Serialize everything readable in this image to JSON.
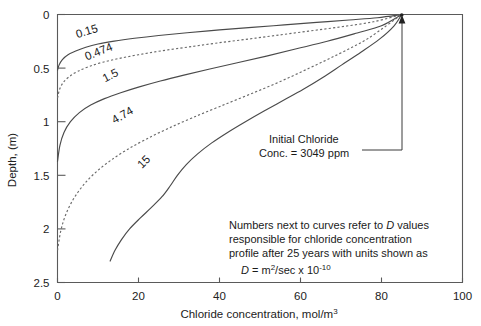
{
  "chart_data": {
    "type": "line",
    "title": "",
    "xlabel": "Chloride concentration, mol/m",
    "xlabel_sup": "3",
    "ylabel": "Depth, (m)",
    "xlim": [
      0,
      100
    ],
    "ylim": [
      0,
      2.5
    ],
    "y_inverted": true,
    "grid": false,
    "legend": "none",
    "xticks": [
      "0",
      "20",
      "40",
      "60",
      "80",
      "100"
    ],
    "xtick_values": [
      0,
      20,
      40,
      60,
      80,
      100
    ],
    "yticks": [
      "0",
      "0.5",
      "1",
      "1.5",
      "2",
      "2.5"
    ],
    "ytick_values": [
      0,
      0.5,
      1,
      1.5,
      2,
      2.5
    ],
    "convergence_point": {
      "x": 85,
      "y": 0
    },
    "series": [
      {
        "name": "0.15",
        "label": "0.15",
        "style": "solid",
        "label_pos": {
          "x": 7.5,
          "y": 0.19
        },
        "label_rotation": -17,
        "points": [
          [
            0,
            0.52
          ],
          [
            0.4,
            0.47
          ],
          [
            1.2,
            0.42
          ],
          [
            2.6,
            0.375
          ],
          [
            4.5,
            0.34
          ],
          [
            7.0,
            0.305
          ],
          [
            10.0,
            0.275
          ],
          [
            14.0,
            0.248
          ],
          [
            19.0,
            0.222
          ],
          [
            25.0,
            0.196
          ],
          [
            32.0,
            0.17
          ],
          [
            40.0,
            0.144
          ],
          [
            48.0,
            0.12
          ],
          [
            56.0,
            0.097
          ],
          [
            64.0,
            0.074
          ],
          [
            72.0,
            0.051
          ],
          [
            79.0,
            0.03
          ],
          [
            85.0,
            0.0
          ]
        ]
      },
      {
        "name": "0.474",
        "label": "0.474",
        "style": "dashed",
        "label_pos": {
          "x": 10.5,
          "y": 0.38
        },
        "label_rotation": -22,
        "points": [
          [
            0,
            0.78
          ],
          [
            0.5,
            0.7
          ],
          [
            1.4,
            0.635
          ],
          [
            2.9,
            0.58
          ],
          [
            5.0,
            0.53
          ],
          [
            7.8,
            0.485
          ],
          [
            11.2,
            0.445
          ],
          [
            15.2,
            0.41
          ],
          [
            20.0,
            0.375
          ],
          [
            25.5,
            0.34
          ],
          [
            32.0,
            0.305
          ],
          [
            39.0,
            0.268
          ],
          [
            46.5,
            0.232
          ],
          [
            54.0,
            0.195
          ],
          [
            62.0,
            0.155
          ],
          [
            70.0,
            0.115
          ],
          [
            78.0,
            0.068
          ],
          [
            85.0,
            0.0
          ]
        ]
      },
      {
        "name": "1.5",
        "label": "1.5",
        "style": "solid",
        "label_pos": {
          "x": 13.5,
          "y": 0.6
        },
        "label_rotation": -27,
        "points": [
          [
            0,
            1.37
          ],
          [
            0.6,
            1.22
          ],
          [
            1.6,
            1.1
          ],
          [
            3.2,
            1.0
          ],
          [
            5.4,
            0.915
          ],
          [
            8.2,
            0.845
          ],
          [
            11.6,
            0.785
          ],
          [
            15.6,
            0.73
          ],
          [
            20.2,
            0.675
          ],
          [
            25.4,
            0.62
          ],
          [
            31.2,
            0.565
          ],
          [
            37.6,
            0.508
          ],
          [
            44.4,
            0.45
          ],
          [
            51.6,
            0.388
          ],
          [
            59.0,
            0.32
          ],
          [
            66.6,
            0.25
          ],
          [
            74.0,
            0.172
          ],
          [
            80.0,
            0.105
          ],
          [
            85.0,
            0.0
          ]
        ]
      },
      {
        "name": "4.74",
        "label": "4.74",
        "style": "dashed",
        "label_pos": {
          "x": 16.5,
          "y": 0.97
        },
        "label_rotation": -30,
        "points": [
          [
            0,
            2.2
          ],
          [
            0.8,
            2.02
          ],
          [
            2.0,
            1.87
          ],
          [
            3.8,
            1.73
          ],
          [
            6.2,
            1.6
          ],
          [
            9.2,
            1.48
          ],
          [
            12.8,
            1.37
          ],
          [
            17.0,
            1.265
          ],
          [
            21.8,
            1.165
          ],
          [
            27.2,
            1.065
          ],
          [
            33.2,
            0.965
          ],
          [
            39.8,
            0.862
          ],
          [
            47.0,
            0.752
          ],
          [
            54.6,
            0.632
          ],
          [
            62.2,
            0.5
          ],
          [
            69.6,
            0.365
          ],
          [
            76.6,
            0.225
          ],
          [
            85.0,
            0.0
          ]
        ]
      },
      {
        "name": "15",
        "label": "15",
        "style": "solid",
        "label_pos": {
          "x": 22.0,
          "y": 1.4
        },
        "label_rotation": -45,
        "points": [
          [
            13.0,
            2.3
          ],
          [
            14.2,
            2.2
          ],
          [
            15.8,
            2.1
          ],
          [
            17.8,
            2.0
          ],
          [
            20.4,
            1.9
          ],
          [
            23.2,
            1.8
          ],
          [
            25.8,
            1.7
          ],
          [
            27.8,
            1.6
          ],
          [
            29.6,
            1.5
          ],
          [
            31.8,
            1.4
          ],
          [
            34.6,
            1.3
          ],
          [
            38.0,
            1.2
          ],
          [
            42.0,
            1.1
          ],
          [
            46.4,
            1.0
          ],
          [
            51.0,
            0.9
          ],
          [
            55.8,
            0.8
          ],
          [
            60.6,
            0.7
          ],
          [
            65.4,
            0.59
          ],
          [
            70.2,
            0.47
          ],
          [
            75.0,
            0.35
          ],
          [
            79.5,
            0.23
          ],
          [
            83.0,
            0.11
          ],
          [
            85.0,
            0.0
          ]
        ]
      }
    ],
    "annotations": [
      {
        "name": "initial-chloride-annotation",
        "lines": [
          "Initial Chloride",
          "Conc. = 3049 ppm"
        ],
        "leader_to": {
          "x": 85,
          "y": 0
        }
      },
      {
        "name": "note-annotation",
        "lines": [
          "Numbers next to curves refer to D values",
          "responsible for chloride concentration",
          "profile after 25 years with units shown as"
        ],
        "formula_prefix": "D",
        "formula_body": " =  m",
        "formula_sup1": "2",
        "formula_mid": "/sec x 10",
        "formula_sup2": "-10"
      }
    ]
  },
  "colors": {
    "axis": "#5a5a5a",
    "curve_solid": "#4a4a4a",
    "curve_dashed": "#6a6a6a",
    "text": "#1a1a1a",
    "background": "#ffffff"
  }
}
